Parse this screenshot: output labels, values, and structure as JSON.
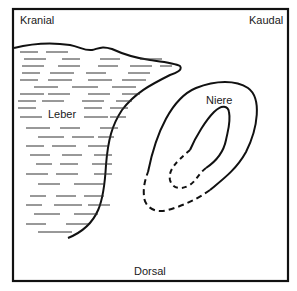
{
  "diagram": {
    "orientation_labels": {
      "top_left": "Kranial",
      "top_right": "Kaudal",
      "bottom": "Dorsal"
    },
    "organs": {
      "liver": {
        "label": "Leber"
      },
      "kidney": {
        "label": "Niere"
      }
    },
    "colors": {
      "stroke": "#111111",
      "hatch": "#333333",
      "background": "#ffffff"
    }
  }
}
